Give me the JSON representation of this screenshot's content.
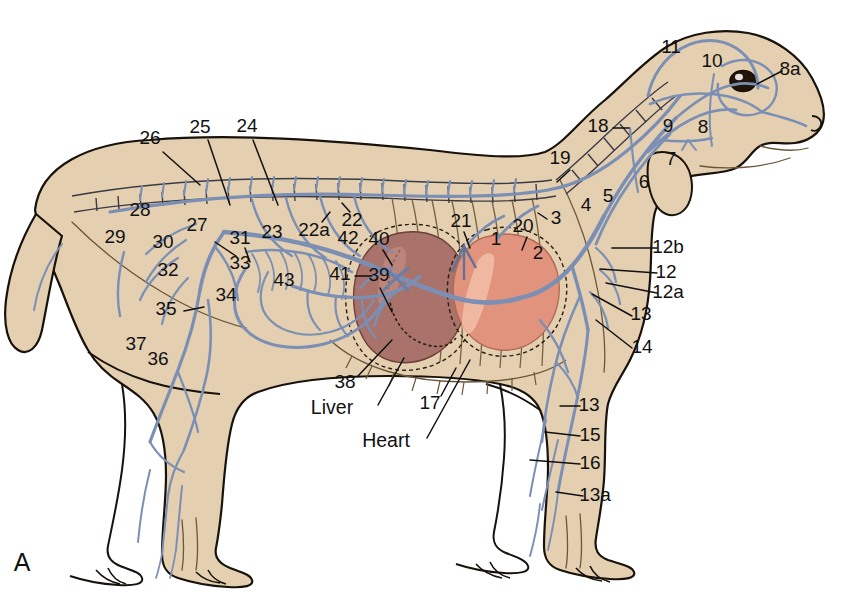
{
  "figure": {
    "panel_letter": "A",
    "title_alt": "Canine venous system, lateral view",
    "colors": {
      "body_fill": "#e4cfb0",
      "outline": "#17120c",
      "vessel_blue": "#7b8fb5",
      "liver": "#a9726a",
      "heart": "#e2937e",
      "label_text": "#111111",
      "background": "#ffffff"
    }
  },
  "organ_labels": [
    {
      "id": "liver",
      "text": "Liver",
      "x": 332,
      "y": 409
    },
    {
      "id": "heart",
      "text": "Heart",
      "x": 386,
      "y": 442
    }
  ],
  "numbered_labels": [
    {
      "id": "n1",
      "text": "1",
      "x": 496,
      "y": 240
    },
    {
      "id": "n2",
      "text": "2",
      "x": 538,
      "y": 254
    },
    {
      "id": "n3",
      "text": "3",
      "x": 556,
      "y": 219
    },
    {
      "id": "n4",
      "text": "4",
      "x": 586,
      "y": 206
    },
    {
      "id": "n5",
      "text": "5",
      "x": 608,
      "y": 197
    },
    {
      "id": "n6",
      "text": "6",
      "x": 644,
      "y": 183
    },
    {
      "id": "n7",
      "text": "7",
      "x": 671,
      "y": 160
    },
    {
      "id": "n8",
      "text": "8",
      "x": 703,
      "y": 128
    },
    {
      "id": "n8a",
      "text": "8a",
      "x": 790,
      "y": 70
    },
    {
      "id": "n9",
      "text": "9",
      "x": 668,
      "y": 127
    },
    {
      "id": "n10",
      "text": "10",
      "x": 712,
      "y": 62
    },
    {
      "id": "n11",
      "text": "11",
      "x": 671,
      "y": 48
    },
    {
      "id": "n12",
      "text": "12",
      "x": 666,
      "y": 273
    },
    {
      "id": "n12a",
      "text": "12a",
      "x": 668,
      "y": 293
    },
    {
      "id": "n12b",
      "text": "12b",
      "x": 668,
      "y": 248
    },
    {
      "id": "n13",
      "text": "13",
      "x": 641,
      "y": 315
    },
    {
      "id": "n13b",
      "text": "13",
      "x": 589,
      "y": 406
    },
    {
      "id": "n13a",
      "text": "13a",
      "x": 595,
      "y": 496
    },
    {
      "id": "n14",
      "text": "14",
      "x": 642,
      "y": 348
    },
    {
      "id": "n15",
      "text": "15",
      "x": 590,
      "y": 436
    },
    {
      "id": "n16",
      "text": "16",
      "x": 590,
      "y": 464
    },
    {
      "id": "n17",
      "text": "17",
      "x": 430,
      "y": 404
    },
    {
      "id": "n18",
      "text": "18",
      "x": 598,
      "y": 127
    },
    {
      "id": "n19",
      "text": "19",
      "x": 560,
      "y": 159
    },
    {
      "id": "n20",
      "text": "20",
      "x": 523,
      "y": 227
    },
    {
      "id": "n21",
      "text": "21",
      "x": 461,
      "y": 222
    },
    {
      "id": "n22",
      "text": "22",
      "x": 352,
      "y": 221
    },
    {
      "id": "n22a",
      "text": "22a",
      "x": 314,
      "y": 231
    },
    {
      "id": "n23",
      "text": "23",
      "x": 272,
      "y": 233
    },
    {
      "id": "n24",
      "text": "24",
      "x": 247,
      "y": 127
    },
    {
      "id": "n25",
      "text": "25",
      "x": 200,
      "y": 128
    },
    {
      "id": "n26",
      "text": "26",
      "x": 150,
      "y": 139
    },
    {
      "id": "n27",
      "text": "27",
      "x": 197,
      "y": 226
    },
    {
      "id": "n28",
      "text": "28",
      "x": 140,
      "y": 211
    },
    {
      "id": "n29",
      "text": "29",
      "x": 115,
      "y": 238
    },
    {
      "id": "n30",
      "text": "30",
      "x": 163,
      "y": 243
    },
    {
      "id": "n31",
      "text": "31",
      "x": 240,
      "y": 239
    },
    {
      "id": "n32",
      "text": "32",
      "x": 168,
      "y": 271
    },
    {
      "id": "n33",
      "text": "33",
      "x": 240,
      "y": 264
    },
    {
      "id": "n34",
      "text": "34",
      "x": 226,
      "y": 296
    },
    {
      "id": "n35",
      "text": "35",
      "x": 166,
      "y": 310
    },
    {
      "id": "n36",
      "text": "36",
      "x": 158,
      "y": 360
    },
    {
      "id": "n37",
      "text": "37",
      "x": 136,
      "y": 345
    },
    {
      "id": "n38",
      "text": "38",
      "x": 345,
      "y": 383
    },
    {
      "id": "n39",
      "text": "39",
      "x": 379,
      "y": 276
    },
    {
      "id": "n40",
      "text": "40",
      "x": 379,
      "y": 240
    },
    {
      "id": "n41",
      "text": "41",
      "x": 340,
      "y": 275
    },
    {
      "id": "n42",
      "text": "42",
      "x": 348,
      "y": 239
    },
    {
      "id": "n43",
      "text": "43",
      "x": 284,
      "y": 281
    }
  ],
  "leader_lines": [
    {
      "id": "l26",
      "d": "M163 152 L200 185"
    },
    {
      "id": "l25",
      "d": "M208 140 L230 205"
    },
    {
      "id": "l24",
      "d": "M253 140 L278 205"
    },
    {
      "id": "l8a",
      "d": "M782 71 L757 84"
    },
    {
      "id": "l19",
      "d": "M570 170 L557 182"
    },
    {
      "id": "l18",
      "d": "M613 128 L629 128"
    },
    {
      "id": "l3",
      "d": "M547 219 L538 213"
    },
    {
      "id": "l12b",
      "d": "M657 248 L612 248"
    },
    {
      "id": "l12",
      "d": "M657 273 L600 269"
    },
    {
      "id": "l12a",
      "d": "M657 293 L606 283"
    },
    {
      "id": "l13",
      "d": "M632 316 L592 294"
    },
    {
      "id": "l14",
      "d": "M632 348 L596 320"
    },
    {
      "id": "l13b",
      "d": "M580 406 L560 406"
    },
    {
      "id": "l15",
      "d": "M580 436 L545 432"
    },
    {
      "id": "l16",
      "d": "M580 464 L530 460"
    },
    {
      "id": "l13a",
      "d": "M583 496 L556 492"
    },
    {
      "id": "l35",
      "d": "M184 311 L204 307"
    },
    {
      "id": "l38",
      "d": "M358 376 L392 340"
    },
    {
      "id": "l17",
      "d": "M441 396 L456 368"
    },
    {
      "id": "l_liver",
      "d": "M378 405 L404 358"
    },
    {
      "id": "l_heart",
      "d": "M427 438 L470 360"
    },
    {
      "id": "l33",
      "d": "M236 256 L215 242"
    },
    {
      "id": "l31",
      "d": "M245 248 L250 262"
    },
    {
      "id": "l41",
      "d": "M355 276 L372 276"
    },
    {
      "id": "l40",
      "d": "M383 250 L392 265"
    },
    {
      "id": "l39",
      "d": "M380 288 L392 312"
    },
    {
      "id": "l21",
      "d": "M464 232 L470 248"
    },
    {
      "id": "l20",
      "d": "M527 237 L522 250"
    },
    {
      "id": "l22a",
      "d": "M322 222 L330 212"
    },
    {
      "id": "l22",
      "d": "M350 212 L342 203"
    }
  ]
}
